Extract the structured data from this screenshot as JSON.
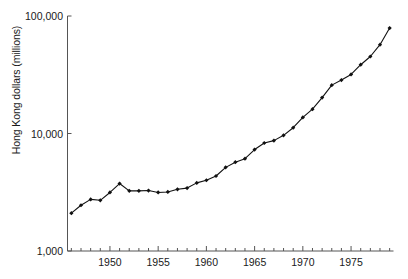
{
  "axes": {
    "ylabel": "Hong Kong dollars (millions)",
    "xlabel": "",
    "yticks": [
      {
        "value": 1000,
        "label": "1,000"
      },
      {
        "value": 10000,
        "label": "10,000"
      },
      {
        "value": 100000,
        "label": "100,000"
      }
    ],
    "xticks": [
      {
        "value": 1950,
        "label": "1950"
      },
      {
        "value": 1955,
        "label": "1955"
      },
      {
        "value": 1960,
        "label": "1960"
      },
      {
        "value": 1965,
        "label": "1965"
      },
      {
        "value": 1970,
        "label": "1970"
      },
      {
        "value": 1975,
        "label": "1975"
      }
    ]
  },
  "chart_data": {
    "type": "line",
    "title": "",
    "subtitle": "",
    "xlabel": "",
    "ylabel": "Hong Kong dollars (millions)",
    "yscale": "log",
    "xscale": "linear",
    "ylim": [
      1000,
      100000
    ],
    "xlim": [
      1945.6,
      1979.4
    ],
    "grid": false,
    "legend": null,
    "marker": "filled-diamond",
    "line_color": "#111111",
    "marker_color": "#111111",
    "x": [
      1946,
      1947,
      1948,
      1949,
      1950,
      1951,
      1952,
      1953,
      1954,
      1955,
      1956,
      1957,
      1958,
      1959,
      1960,
      1961,
      1962,
      1963,
      1964,
      1965,
      1966,
      1967,
      1968,
      1969,
      1970,
      1971,
      1972,
      1973,
      1974,
      1975,
      1976,
      1977,
      1978,
      1979
    ],
    "values": [
      2100,
      2450,
      2750,
      2700,
      3150,
      3750,
      3250,
      3250,
      3270,
      3150,
      3180,
      3350,
      3430,
      3800,
      4000,
      4350,
      5150,
      5700,
      6100,
      7300,
      8300,
      8700,
      9650,
      11200,
      13700,
      16100,
      20200,
      25800,
      28500,
      31800,
      38500,
      45200,
      57000,
      79000
    ],
    "tick_labels_x": [
      "1950",
      "1955",
      "1960",
      "1965",
      "1970",
      "1975"
    ],
    "tick_labels_y": [
      "1,000",
      "10,000",
      "100,000"
    ],
    "minor_xticks_every": 1
  },
  "style": {
    "background": "#ffffff",
    "axis_color": "#555555",
    "text_color": "#1a1a1a"
  }
}
